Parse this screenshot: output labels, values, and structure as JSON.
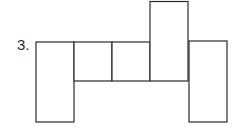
{
  "problem": {
    "number_label": "3."
  },
  "net": {
    "stroke_color": "#2a2a2a",
    "fill_color": "#ffffff",
    "faces": [
      {
        "name": "left-face",
        "x": 36,
        "y": 42,
        "w": 38,
        "h": 80
      },
      {
        "name": "middle-face-1",
        "x": 74,
        "y": 42,
        "w": 38,
        "h": 39
      },
      {
        "name": "middle-face-2",
        "x": 112,
        "y": 42,
        "w": 38,
        "h": 39
      },
      {
        "name": "top-face",
        "x": 150,
        "y": 1,
        "w": 38,
        "h": 80
      },
      {
        "name": "right-face",
        "x": 189,
        "y": 41,
        "w": 38,
        "h": 81
      }
    ]
  }
}
